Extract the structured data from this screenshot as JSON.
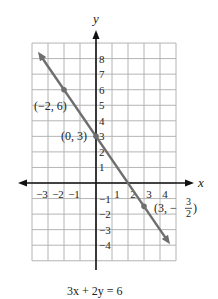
{
  "chart_data": {
    "type": "line",
    "title": "",
    "caption": "3x + 2y = 6",
    "xlabel": "x",
    "ylabel": "y",
    "xlim": [
      -4,
      5
    ],
    "ylim": [
      -5,
      9
    ],
    "grid": true,
    "x_tick_labels": [
      "-3",
      "-2",
      "-1",
      "1",
      "2",
      "3",
      "4"
    ],
    "x_ticks": [
      -3,
      -2,
      -1,
      1,
      2,
      3,
      4
    ],
    "y_tick_labels": [
      "8",
      "7",
      "6",
      "5",
      "4",
      "3",
      "2",
      "1",
      "-1",
      "-2",
      "-3",
      "-4"
    ],
    "y_ticks": [
      8,
      7,
      6,
      5,
      4,
      3,
      2,
      1,
      -1,
      -2,
      -3,
      -4
    ],
    "series": [
      {
        "name": "3x + 2y = 6",
        "equation": "y = -1.5x + 3",
        "slope": -1.5,
        "intercept": 3,
        "x": [
          -3.5,
          4.5
        ],
        "y": [
          8.25,
          -3.75
        ],
        "color": "#6e6e6e"
      }
    ],
    "points": [
      {
        "x": -2,
        "y": 6,
        "label": "(-2, 6)"
      },
      {
        "x": 0,
        "y": 3,
        "label": "(0, 3)"
      },
      {
        "x": 3,
        "y": -1.5,
        "label_prefix": "(3, -",
        "label_num": "3",
        "label_den": "2",
        "label_suffix": ")"
      }
    ]
  },
  "colors": {
    "grid": "#b4b4b4",
    "axes": "#111111",
    "line": "#6e6e6e",
    "text": "#222222"
  }
}
